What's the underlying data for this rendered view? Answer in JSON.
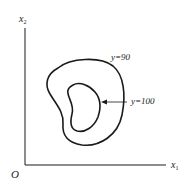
{
  "diagram": {
    "type": "level-set / isoquant contour diagram",
    "axes": {
      "origin_label": "O",
      "x_label": "x",
      "x_subscript": "1",
      "y_label": "x",
      "y_subscript": "2"
    },
    "contours": [
      {
        "label": "y=90",
        "level": 90,
        "role": "outer"
      },
      {
        "label": "y=100",
        "level": 100,
        "role": "inner"
      }
    ],
    "colors": {
      "line": "#1a1a1a",
      "text": "#222222",
      "background": "#ffffff"
    }
  }
}
